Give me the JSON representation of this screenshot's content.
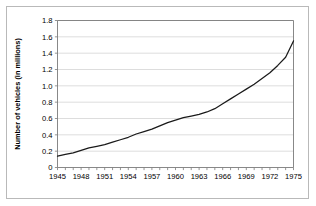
{
  "chart_data": {
    "type": "line",
    "title": "",
    "xlabel": "",
    "ylabel": "Number of vehicles (in millions)",
    "xlim": [
      1945,
      1975
    ],
    "ylim": [
      0,
      1.8
    ],
    "grid": true,
    "legend": null,
    "ytick_labels": [
      "0",
      "0.2",
      "0.4",
      "0.6",
      "0.8",
      "1.0",
      "1.2",
      "1.4",
      "1.6",
      "1.8"
    ],
    "ytick_values": [
      0,
      0.2,
      0.4,
      0.6,
      0.8,
      1.0,
      1.2,
      1.4,
      1.6,
      1.8
    ],
    "xtick_labels": [
      "1945",
      "1948",
      "1951",
      "1954",
      "1957",
      "1960",
      "1963",
      "1966",
      "1969",
      "1972",
      "1975"
    ],
    "xtick_values": [
      1945,
      1948,
      1951,
      1954,
      1957,
      1960,
      1963,
      1966,
      1969,
      1972,
      1975
    ],
    "xminor_values": [
      1945,
      1946,
      1947,
      1948,
      1949,
      1950,
      1951,
      1952,
      1953,
      1954,
      1955,
      1956,
      1957,
      1958,
      1959,
      1960,
      1961,
      1962,
      1963,
      1964,
      1965,
      1966,
      1967,
      1968,
      1969,
      1970,
      1971,
      1972,
      1973,
      1974,
      1975
    ],
    "line_color": "#1a1a1a",
    "grid_color": "#d4d4d4",
    "axis_color": "#7a7a7a",
    "x": [
      1945,
      1946,
      1947,
      1948,
      1949,
      1950,
      1951,
      1952,
      1953,
      1954,
      1955,
      1956,
      1957,
      1958,
      1959,
      1960,
      1961,
      1962,
      1963,
      1964,
      1965,
      1966,
      1967,
      1968,
      1969,
      1970,
      1971,
      1972,
      1973,
      1974,
      1975
    ],
    "values": [
      0.14,
      0.16,
      0.18,
      0.21,
      0.24,
      0.26,
      0.28,
      0.31,
      0.34,
      0.37,
      0.41,
      0.44,
      0.47,
      0.51,
      0.55,
      0.58,
      0.61,
      0.63,
      0.65,
      0.68,
      0.72,
      0.78,
      0.84,
      0.9,
      0.96,
      1.02,
      1.09,
      1.16,
      1.25,
      1.35,
      1.55
    ]
  }
}
